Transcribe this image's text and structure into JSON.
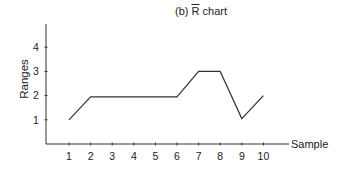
{
  "chart_data": {
    "type": "line",
    "title_prefix": "(b) ",
    "title_symbol": "R",
    "title_suffix": " chart",
    "xlabel": "Sample",
    "ylabel": "Ranges",
    "x": [
      1,
      2,
      3,
      4,
      5,
      6,
      7,
      8,
      9,
      10
    ],
    "values": [
      1,
      1.95,
      1.95,
      1.95,
      1.95,
      1.95,
      3,
      3,
      1.05,
      2
    ],
    "yticks": [
      1,
      2,
      3,
      4
    ],
    "xticks": [
      1,
      2,
      3,
      4,
      5,
      6,
      7,
      8,
      9,
      10
    ],
    "ylim": [
      0,
      5
    ],
    "xlim": [
      0,
      11
    ],
    "grid": false,
    "legend": null,
    "line_color": "#333333"
  }
}
